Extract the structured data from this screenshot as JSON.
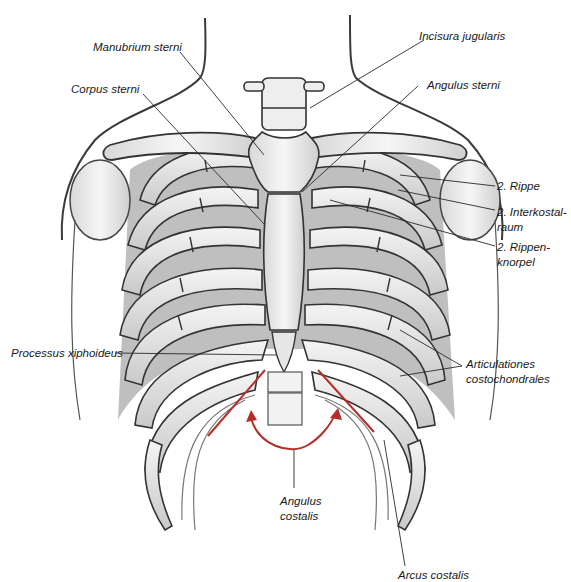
{
  "figure": {
    "accent_color": "#b3302a",
    "line_color": "#2a2a2a"
  },
  "labels": {
    "manubrium": "Manubrium sterni",
    "incisura": "Incisura jugularis",
    "corpus": "Corpus sterni",
    "angulus_sterni": "Angulus sterni",
    "rippe2": "2. Rippe",
    "interkostal_1": "2. Interkostal-",
    "interkostal_2": "raum",
    "rippenknorpel_1": "2. Rippen-",
    "rippenknorpel_2": "knorpel",
    "xiphoid": "Processus xiphoideus",
    "artic_1": "Articulationes",
    "artic_2": "costochondrales",
    "angulus_costalis_1": "Angulus",
    "angulus_costalis_2": "costalis",
    "arcus": "Arcus costalis"
  }
}
